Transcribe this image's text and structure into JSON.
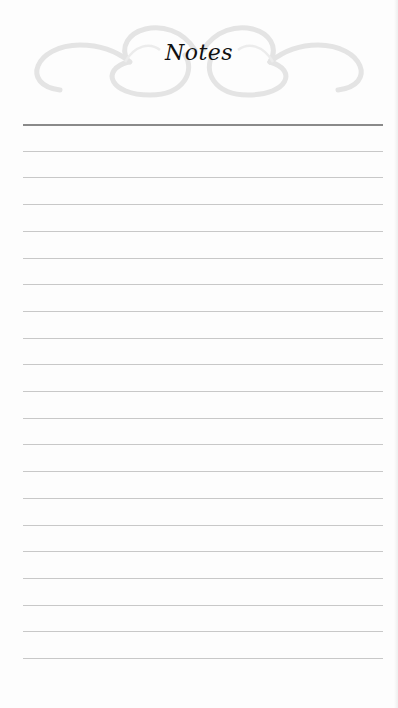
{
  "header": {
    "title": "Notes"
  },
  "page": {
    "line_count": 21,
    "first_line_y": 124,
    "line_spacing": 26.7,
    "line_left": 23,
    "line_width": 360,
    "colors": {
      "paper": "#fdfdfd",
      "rule": "#c8c8c8",
      "top_rule": "#8a8a8a",
      "flourish": "#e6e6e6",
      "title": "#111111"
    }
  }
}
